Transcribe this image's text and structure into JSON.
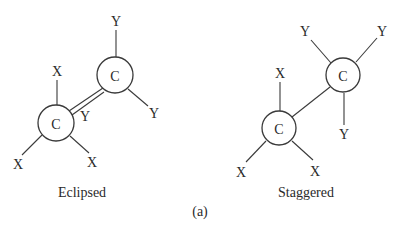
{
  "figure": {
    "label": "(a)",
    "panels": [
      {
        "caption": "Eclipsed",
        "lower_carbon": {
          "label": "C",
          "substituents": [
            "X",
            "X",
            "X"
          ]
        },
        "upper_carbon": {
          "label": "C",
          "substituents": [
            "Y",
            "Y",
            "Y"
          ]
        }
      },
      {
        "caption": "Staggered",
        "lower_carbon": {
          "label": "C",
          "substituents": [
            "X",
            "X",
            "X"
          ]
        },
        "upper_carbon": {
          "label": "C",
          "substituents": [
            "Y",
            "Y",
            "Y"
          ]
        }
      }
    ]
  }
}
